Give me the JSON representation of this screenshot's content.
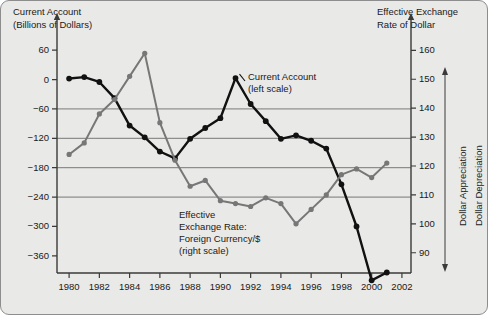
{
  "chart_data": {
    "type": "line",
    "title": "",
    "xlabel": "",
    "x": [
      1980,
      1981,
      1982,
      1983,
      1984,
      1985,
      1986,
      1987,
      1988,
      1989,
      1990,
      1991,
      1992,
      1993,
      1994,
      1995,
      1996,
      1997,
      1998,
      1999,
      2000,
      2001
    ],
    "xlim": [
      1979.2,
      2002.6
    ],
    "xticks": [
      1980,
      1982,
      1984,
      1986,
      1988,
      1990,
      1992,
      1994,
      1996,
      1998,
      2000,
      2002
    ],
    "xticklabels": [
      "1980",
      "1982",
      "1984",
      "1986",
      "1988",
      "1990",
      "1992",
      "1994",
      "1996",
      "1998",
      "2000",
      "2002"
    ],
    "grid": true,
    "gridlines_left": [
      -60,
      -120,
      -180,
      -240
    ],
    "gridlines_right": [
      140,
      130,
      120,
      110
    ],
    "left_axis": {
      "label": "Current Account\n(Billions of Dollars)",
      "label_line1": "Current Account",
      "label_line2": "(Billions of Dollars)",
      "ticks": [
        60,
        0,
        -60,
        -120,
        -180,
        -240,
        -300,
        -360
      ],
      "ticklabels": [
        "60",
        "0",
        "−60",
        "−120",
        "−180",
        "−240",
        "−300",
        "−360"
      ],
      "ylim": [
        -395,
        95
      ]
    },
    "right_axis": {
      "label": "Effective Exchange\nRate of Dollar",
      "label_line1": "Effective Exchange",
      "label_line2": "Rate of Dollar",
      "ticks": [
        160,
        150,
        140,
        130,
        120,
        110,
        100,
        90
      ],
      "ticklabels": [
        "160",
        "150",
        "140",
        "130",
        "120",
        "110",
        "100",
        "90"
      ],
      "ylim": [
        83,
        166
      ],
      "direction_up_label": "Dollar Appreciation",
      "direction_down_label": "Dollar Depreciation"
    },
    "series": [
      {
        "name": "Current Account",
        "axis": "left",
        "color": "#111111",
        "annotation_line1": "Current Account",
        "annotation_line2": "(left scale)",
        "values": [
          2,
          5,
          -5,
          -38,
          -94,
          -118,
          -147,
          -161,
          -121,
          -99,
          -79,
          3,
          -50,
          -85,
          -121,
          -114,
          -125,
          -141,
          -214,
          -300,
          -410,
          -394
        ]
      },
      {
        "name": "Effective Exchange Rate: Foreign Currency/$",
        "axis": "right",
        "color": "#777777",
        "annotation_line1": "Effective",
        "annotation_line2": "Exchange Rate:",
        "annotation_line3": "Foreign Currency/$",
        "annotation_line4": "(right scale)",
        "values": [
          124,
          128,
          138,
          143,
          151,
          159,
          135,
          122,
          113,
          115,
          108,
          107,
          106,
          109,
          107,
          100,
          105,
          110,
          117,
          119,
          116,
          121
        ]
      }
    ]
  }
}
